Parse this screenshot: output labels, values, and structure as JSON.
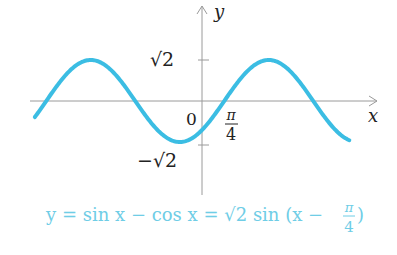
{
  "chart_data": {
    "type": "line",
    "title": "",
    "xlabel": "x",
    "ylabel": "y",
    "function": "y = sin x - cos x = sqrt(2) sin(x - pi/4)",
    "amplitude": 1.4142,
    "phase_shift": 0.7854,
    "xlim": [
      -5.9,
      5.8
    ],
    "ylim": [
      -1.75,
      2.75
    ],
    "grid": false,
    "origin_label": "0",
    "x_tick_labels": [
      {
        "value": 0.7854,
        "num": "π",
        "den": "4"
      }
    ],
    "y_tick_labels": [
      {
        "value": 1.4142,
        "label": "√2"
      },
      {
        "value": -1.4142,
        "label": "−√2"
      }
    ],
    "series": [
      {
        "name": "y = sin x − cos x",
        "color": "#3bbde3",
        "x_range": [
          -5.9,
          5.2
        ]
      }
    ],
    "caption": {
      "lhs": "y = sin x − cos x = ",
      "sqrt2": "√2",
      "rhs": " sin (x − ",
      "frac_num": "π",
      "frac_den": "4",
      "close": ")"
    },
    "caption_color": "#6fcde6"
  }
}
